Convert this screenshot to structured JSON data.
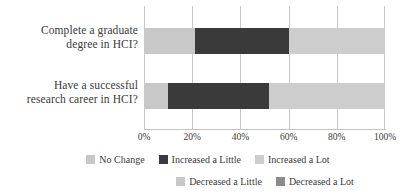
{
  "chart_data": {
    "type": "bar",
    "orientation": "horizontal",
    "stacked": true,
    "stack_mode": "percent",
    "title": "",
    "subtitle": "",
    "xlabel": "",
    "ylabel": "",
    "xlim": [
      0,
      100
    ],
    "xticks": [
      0,
      20,
      40,
      60,
      80,
      100
    ],
    "xtick_labels": [
      "0%",
      "20%",
      "40%",
      "60%",
      "80%",
      "100%"
    ],
    "grid": true,
    "grid_axis": "x",
    "legend_position": "bottom",
    "categories": [
      "Complete a graduate degree in HCI?",
      "Have a successful research career in HCI?"
    ],
    "category_label_lines": [
      [
        "Complete a graduate",
        "degree in HCI?"
      ],
      [
        "Have a successful",
        "research career in HCI?"
      ]
    ],
    "series": [
      {
        "name": "No Change",
        "color": "#c8c8c8",
        "values": [
          21,
          10
        ]
      },
      {
        "name": "Increased a Little",
        "color": "#3a3a3a",
        "values": [
          39,
          42
        ]
      },
      {
        "name": "Increased a Lot",
        "color": "#cdcdcd",
        "values": [
          40,
          48
        ]
      },
      {
        "name": "Decreased a Little",
        "color": "#c8c8c8",
        "values": [
          0,
          0
        ]
      },
      {
        "name": "Decreased a Lot",
        "color": "#8c8c8c",
        "values": [
          0,
          0
        ]
      }
    ],
    "segments": [
      {
        "category": "Complete a graduate degree in HCI?",
        "parts": [
          {
            "label": "No Change",
            "start": 0,
            "end": 21,
            "value": 21
          },
          {
            "label": "Increased a Little",
            "start": 21,
            "end": 60,
            "value": 39
          },
          {
            "label": "Increased a Lot",
            "start": 60,
            "end": 100,
            "value": 40
          }
        ]
      },
      {
        "category": "Have a successful research career in HCI?",
        "parts": [
          {
            "label": "No Change",
            "start": 0,
            "end": 10,
            "value": 10
          },
          {
            "label": "Increased a Little",
            "start": 10,
            "end": 52,
            "value": 42
          },
          {
            "label": "Increased a Lot",
            "start": 52,
            "end": 100,
            "value": 48
          }
        ]
      }
    ],
    "legend": {
      "rows": [
        [
          {
            "label": "No Change",
            "color": "#c8c8c8"
          },
          {
            "label": "Increased a Little",
            "color": "#3a3a3a"
          },
          {
            "label": "Increased a Lot",
            "color": "#cdcdcd"
          }
        ],
        [
          {
            "label": "Decreased a Little",
            "color": "#c8c8c8"
          },
          {
            "label": "Decreased a Lot",
            "color": "#8c8c8c"
          }
        ]
      ]
    },
    "colors": {
      "no_change": "#c8c8c8",
      "increased_a_little": "#3a3a3a",
      "increased_a_lot": "#cdcdcd",
      "decreased_a_little": "#c8c8c8",
      "decreased_a_lot": "#8c8c8c",
      "gridline": "#c9c9c9",
      "text": "#3a3a3a",
      "background": "#ffffff"
    }
  }
}
